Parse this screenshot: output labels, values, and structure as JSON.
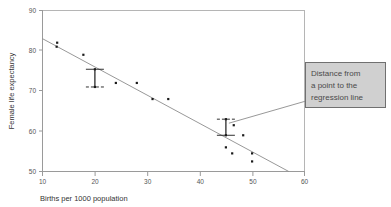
{
  "chart_data": {
    "type": "scatter",
    "title": "",
    "xlabel": "Births per 1000 population",
    "ylabel": "Female life expectancy",
    "xlim": [
      10,
      60
    ],
    "ylim": [
      50,
      90
    ],
    "xticks": [
      "10",
      "20",
      "30",
      "40",
      "50",
      "60"
    ],
    "yticks": [
      "50",
      "60",
      "70",
      "80",
      "90"
    ],
    "grid": false,
    "legend": "none",
    "points": [
      {
        "x": 12.8,
        "y": 82.0
      },
      {
        "x": 12.7,
        "y": 81.0
      },
      {
        "x": 17.8,
        "y": 79.0
      },
      {
        "x": 20.0,
        "y": 75.4
      },
      {
        "x": 20.0,
        "y": 71.0
      },
      {
        "x": 24.0,
        "y": 72.0
      },
      {
        "x": 28.0,
        "y": 72.0
      },
      {
        "x": 31.0,
        "y": 68.0
      },
      {
        "x": 34.0,
        "y": 68.0
      },
      {
        "x": 45.0,
        "y": 63.0
      },
      {
        "x": 45.0,
        "y": 59.0
      },
      {
        "x": 46.5,
        "y": 61.5
      },
      {
        "x": 45.0,
        "y": 56.0
      },
      {
        "x": 46.2,
        "y": 54.5
      },
      {
        "x": 48.3,
        "y": 59.0
      },
      {
        "x": 50.0,
        "y": 54.5
      },
      {
        "x": 50.0,
        "y": 52.5
      }
    ],
    "regression_line": {
      "label": "regression line",
      "x0": 10.0,
      "y0": 83.0,
      "x1": 57.0,
      "y1": 50.0
    },
    "residual_markers": [
      {
        "label": "residual-left",
        "x": 20.0,
        "y_line": 75.4,
        "y_point": 71.0
      },
      {
        "label": "residual-right",
        "x": 45.0,
        "y_line": 59.0,
        "y_point": 63.0
      }
    ],
    "annotations": [
      {
        "name": "distance-callout",
        "lines": [
          "Distance from",
          "a point to the",
          "regression line"
        ],
        "target_x": 45.0,
        "target_y": 62.0
      }
    ],
    "colors": {
      "point": "#1a1a1a",
      "line": "#8c8c8c",
      "axis": "#9a9a9a",
      "callout_fill": "#d0d0d0",
      "callout_border": "#707070",
      "text": "#4a4a4a"
    }
  },
  "axis": {
    "x_title": "Births per 1000 population",
    "y_title": "Female life expectancy",
    "x_tick_0": "10",
    "x_tick_1": "20",
    "x_tick_2": "30",
    "x_tick_3": "40",
    "x_tick_4": "50",
    "x_tick_5": "60",
    "y_tick_0": "50",
    "y_tick_1": "60",
    "y_tick_2": "70",
    "y_tick_3": "80",
    "y_tick_4": "90"
  },
  "callout": {
    "line1": "Distance from",
    "line2": "a point to the",
    "line3": "regression line"
  }
}
